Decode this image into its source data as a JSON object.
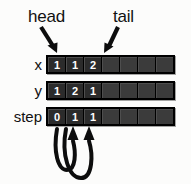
{
  "diagram": {
    "background_color": "#fcfcfb",
    "cell_fill_color": "#2b2b2b",
    "cell_empty_color": "#3b3b3b",
    "border_color": "#000000",
    "text_color": "#ffffff",
    "annotations": [
      {
        "id": "head",
        "label": "head",
        "points_to": "cell-0",
        "direction": "down-right"
      },
      {
        "id": "tail",
        "label": "tail",
        "points_to": "cell-3",
        "direction": "down-left"
      }
    ],
    "rows": [
      {
        "id": "x",
        "label": "x",
        "cells": [
          "1",
          "1",
          "2",
          "",
          "",
          "",
          ""
        ]
      },
      {
        "id": "y",
        "label": "y",
        "cells": [
          "1",
          "2",
          "1",
          "",
          "",
          "",
          ""
        ]
      },
      {
        "id": "step",
        "label": "step",
        "cells": [
          "0",
          "1",
          "1",
          "",
          "",
          "",
          ""
        ]
      }
    ],
    "back_arrows": [
      {
        "id": "back-arrow-1",
        "from_cell": 0,
        "to_cell": 1
      },
      {
        "id": "back-arrow-2",
        "from_cell": 1,
        "to_cell": 2
      }
    ]
  }
}
